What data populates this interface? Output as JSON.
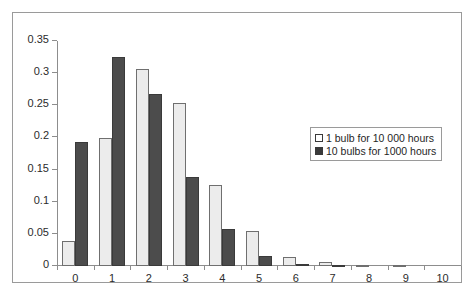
{
  "chart_data": {
    "type": "bar",
    "title": "",
    "subtitle": "",
    "xlabel": "",
    "ylabel": "",
    "categories": [
      "0",
      "1",
      "2",
      "3",
      "4",
      "5",
      "6",
      "7",
      "8",
      "9",
      "10"
    ],
    "series": [
      {
        "name": "1 bulb for 10 000 hours",
        "color": "#ececec",
        "values": [
          0.039,
          0.199,
          0.307,
          0.254,
          0.126,
          0.055,
          0.014,
          0.006,
          0.002,
          0.001,
          0.0
        ]
      },
      {
        "name": "10 bulbs for 1000 hours",
        "color": "#4c4c4c",
        "values": [
          0.193,
          0.325,
          0.268,
          0.139,
          0.057,
          0.016,
          0.003,
          0.001,
          0.0,
          0.0,
          0.0
        ]
      }
    ],
    "ylim": [
      0,
      0.35
    ],
    "yticks": [
      0,
      0.05,
      0.1,
      0.15,
      0.2,
      0.25,
      0.3,
      0.35
    ],
    "ytick_labels": [
      "0",
      "0.05",
      "0.1",
      "0.15",
      "0.2",
      "0.25",
      "0.3",
      "0.35"
    ],
    "xticks": [
      "0",
      "1",
      "2",
      "3",
      "4",
      "5",
      "6",
      "7",
      "8",
      "9",
      "10"
    ],
    "grid": false,
    "legend_position": "right-middle"
  },
  "legend": {
    "entries": [
      {
        "label": "1 bulb for 10 000 hours",
        "swatch": "light"
      },
      {
        "label": "10 bulbs for 1000 hours",
        "swatch": "dark"
      }
    ]
  }
}
